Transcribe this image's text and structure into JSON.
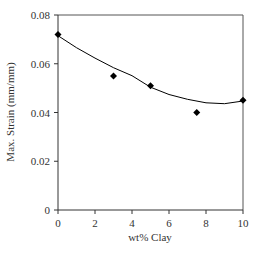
{
  "chart_data": {
    "type": "scatter",
    "title": "",
    "xlabel": "wt% Clay",
    "ylabel": "Max. Strain (mm/mm)",
    "xlim": [
      0,
      10
    ],
    "ylim": [
      0,
      0.08
    ],
    "xticks": [
      0,
      2,
      4,
      6,
      8,
      10
    ],
    "yticks": [
      0,
      0.02,
      0.04,
      0.06,
      0.08
    ],
    "xtick_labels": [
      "0",
      "2",
      "4",
      "6",
      "8",
      "10"
    ],
    "ytick_labels": [
      "0",
      "0.02",
      "0.04",
      "0.06",
      "0.08"
    ],
    "grid": false,
    "legend": null,
    "series": [
      {
        "name": "Measured",
        "marker": "diamond",
        "color": "#000000",
        "x": [
          0,
          3,
          5,
          7.5,
          10
        ],
        "y": [
          0.072,
          0.055,
          0.051,
          0.04,
          0.045
        ]
      },
      {
        "name": "Fit (polynomial trend)",
        "type": "line",
        "color": "#000000",
        "x": [
          0,
          1,
          2,
          3,
          4,
          5,
          6,
          7,
          8,
          9,
          10
        ],
        "y": [
          0.0715,
          0.0666,
          0.0623,
          0.0584,
          0.0551,
          0.0504,
          0.0474,
          0.0454,
          0.044,
          0.0436,
          0.0447
        ]
      }
    ]
  }
}
